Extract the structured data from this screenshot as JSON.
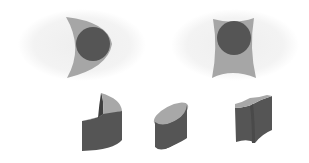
{
  "diagram": {
    "colors": {
      "background": "#ffffff",
      "halo": "#f1f1f1",
      "light_face": "#a6a6a6",
      "dark_fill": "#555555",
      "side_face": "#5a5a5a",
      "top_face": "#a8a8a8"
    },
    "top_row": [
      {
        "name": "crescent-with-circle",
        "description": "Crescent-shaped surface with dark circle inside"
      },
      {
        "name": "concave-quad-with-circle",
        "description": "Concave-sided quadrilateral with dark circle inside"
      }
    ],
    "bottom_row": [
      {
        "name": "curved-c-prism"
      },
      {
        "name": "elliptical-cylinder"
      },
      {
        "name": "concave-prism"
      }
    ]
  }
}
